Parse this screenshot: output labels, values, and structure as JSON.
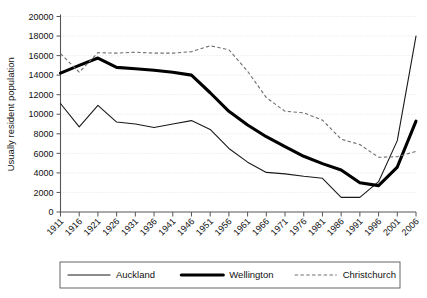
{
  "chart_data": {
    "type": "line",
    "title": "",
    "xlabel": "",
    "ylabel": "Usually resident population",
    "ylim": [
      0,
      20000
    ],
    "ytick_step": 2000,
    "yticks": [
      "0",
      "2000",
      "4000",
      "6000",
      "8000",
      "10000",
      "12000",
      "14000",
      "16000",
      "18000",
      "20000"
    ],
    "grid": true,
    "legend_position": "bottom",
    "categories": [
      "1911",
      "1916",
      "1921",
      "1926",
      "1931",
      "1936",
      "1941",
      "1946",
      "1951",
      "1956",
      "1961",
      "1966",
      "1971",
      "1976",
      "1981",
      "1986",
      "1991",
      "1996",
      "2001",
      "2006"
    ],
    "series": [
      {
        "name": "Auckland",
        "style": "solid-thin",
        "color": "#1a1a1a",
        "values": [
          11100,
          8700,
          10900,
          9200,
          9000,
          8650,
          9000,
          9350,
          8450,
          6500,
          5100,
          4050,
          3900,
          3650,
          3450,
          1500,
          1500,
          3100,
          7300,
          18000
        ]
      },
      {
        "name": "Wellington",
        "style": "solid-thick",
        "color": "#000000",
        "values": [
          14200,
          15000,
          15750,
          14800,
          14650,
          14500,
          14300,
          14000,
          12200,
          10300,
          8900,
          7700,
          6700,
          5700,
          4950,
          4300,
          3000,
          2700,
          4600,
          9300
        ]
      },
      {
        "name": "Christchurch",
        "style": "dashed",
        "color": "#6e6e6e",
        "values": [
          16200,
          14300,
          16300,
          16250,
          16350,
          16250,
          16250,
          16400,
          17000,
          16600,
          14400,
          11700,
          10300,
          10150,
          9400,
          7450,
          6900,
          5600,
          5650,
          6200
        ]
      }
    ],
    "series_extra_tail": {
      "note": ""
    }
  },
  "legend": {
    "items": [
      {
        "label": "Auckland",
        "style": "solid-thin"
      },
      {
        "label": "Wellington",
        "style": "solid-thick"
      },
      {
        "label": "Christchurch",
        "style": "dashed"
      }
    ]
  }
}
